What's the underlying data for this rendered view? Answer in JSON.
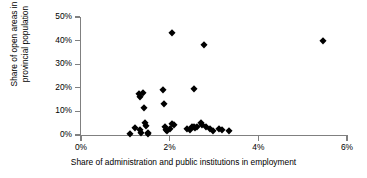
{
  "chart_data": {
    "type": "scatter",
    "title": "",
    "xlabel": "Share of administration and public institutions in employment",
    "ylabel_line1": "Share of open areas in",
    "ylabel_line2": "provincial population",
    "ylabel": "Share of open areas in provincial population",
    "xlim": [
      0,
      6
    ],
    "ylim": [
      0,
      50
    ],
    "xticks": [
      0,
      2,
      4,
      6
    ],
    "yticks": [
      0,
      10,
      20,
      30,
      40,
      50
    ],
    "xtick_labels": [
      "0%",
      "2%",
      "4%",
      "6%"
    ],
    "ytick_labels": [
      "0%",
      "10%",
      "20%",
      "30%",
      "40%",
      "50%"
    ],
    "grid": false,
    "legend": false,
    "marker": "diamond",
    "marker_color": "#000000",
    "axis_color": "#808080",
    "points": [
      {
        "x": 1.1,
        "y": 0.6
      },
      {
        "x": 1.22,
        "y": 3.0
      },
      {
        "x": 1.3,
        "y": 17.2
      },
      {
        "x": 1.33,
        "y": 16.2
      },
      {
        "x": 1.34,
        "y": 2.0
      },
      {
        "x": 1.36,
        "y": 1.0
      },
      {
        "x": 1.4,
        "y": 18.0
      },
      {
        "x": 1.42,
        "y": 11.3
      },
      {
        "x": 1.45,
        "y": 5.2
      },
      {
        "x": 1.47,
        "y": 4.0
      },
      {
        "x": 1.5,
        "y": 0.8
      },
      {
        "x": 1.52,
        "y": 0.5
      },
      {
        "x": 1.86,
        "y": 19.1
      },
      {
        "x": 1.88,
        "y": 13.0
      },
      {
        "x": 1.9,
        "y": 3.3
      },
      {
        "x": 1.92,
        "y": 2.0
      },
      {
        "x": 1.95,
        "y": 1.5
      },
      {
        "x": 2.0,
        "y": 2.4
      },
      {
        "x": 2.05,
        "y": 43.4
      },
      {
        "x": 2.06,
        "y": 4.6
      },
      {
        "x": 2.1,
        "y": 4.2
      },
      {
        "x": 2.4,
        "y": 2.7
      },
      {
        "x": 2.45,
        "y": 2.2
      },
      {
        "x": 2.5,
        "y": 3.4
      },
      {
        "x": 2.54,
        "y": 3.2
      },
      {
        "x": 2.56,
        "y": 19.4
      },
      {
        "x": 2.58,
        "y": 2.9
      },
      {
        "x": 2.62,
        "y": 3.3
      },
      {
        "x": 2.7,
        "y": 5.1
      },
      {
        "x": 2.74,
        "y": 4.4
      },
      {
        "x": 2.78,
        "y": 38.0
      },
      {
        "x": 2.82,
        "y": 3.3
      },
      {
        "x": 2.9,
        "y": 2.6
      },
      {
        "x": 2.98,
        "y": 1.5
      },
      {
        "x": 3.12,
        "y": 2.4
      },
      {
        "x": 3.18,
        "y": 2.3
      },
      {
        "x": 3.34,
        "y": 1.7
      },
      {
        "x": 5.45,
        "y": 39.7
      }
    ]
  }
}
